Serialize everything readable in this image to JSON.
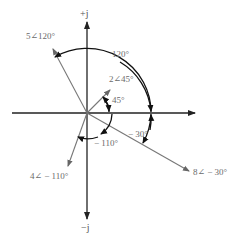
{
  "diagram": {
    "type": "phasor-diagram",
    "origin": {
      "x": 87,
      "y": 113
    },
    "axes": {
      "positive_imag_label": "+j",
      "negative_imag_label": "−j"
    },
    "phasors": [
      {
        "name": "phasor-5-120",
        "magnitude": 5,
        "angle_deg": 120,
        "label": "5∠120°"
      },
      {
        "name": "phasor-2-45",
        "magnitude": 2,
        "angle_deg": 45,
        "label": "2∠45°"
      },
      {
        "name": "phasor-8-neg30",
        "magnitude": 8,
        "angle_deg": -30,
        "label": "8∠ − 30°"
      },
      {
        "name": "phasor-4-neg110",
        "magnitude": 4,
        "angle_deg": -110,
        "label": "4∠ − 110°"
      }
    ],
    "angle_labels": {
      "a120": "120°",
      "a45": "45°",
      "aneg30": "− 30°",
      "aneg110": "− 110°"
    },
    "colors": {
      "axis": "#222222",
      "phasor": "#777777",
      "arc": "#111111",
      "label": "#6b6b6b"
    }
  }
}
